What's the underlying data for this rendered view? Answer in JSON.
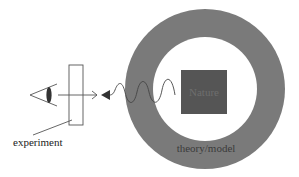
{
  "diagram": {
    "nodes": {
      "nature": {
        "label": "Nature",
        "fill": "#555555",
        "text_color": "#6e6e6e"
      },
      "theory_model": {
        "label": "theory/model",
        "fill": "#7a7a7a",
        "text_color": "#3a3a3a"
      },
      "experiment": {
        "label": "experiment",
        "text_color": "#222222"
      },
      "observer": {
        "label": ""
      }
    },
    "edges": [
      {
        "from": "nature",
        "to": "experiment",
        "style": "wave-with-filled-arrowhead"
      },
      {
        "from": "observer",
        "to": "experiment",
        "style": "line-with-open-arrowhead"
      }
    ],
    "colors": {
      "background": "#ffffff",
      "ring": "#7a7a7a",
      "inner": "#ffffff",
      "stroke": "#555555"
    }
  }
}
